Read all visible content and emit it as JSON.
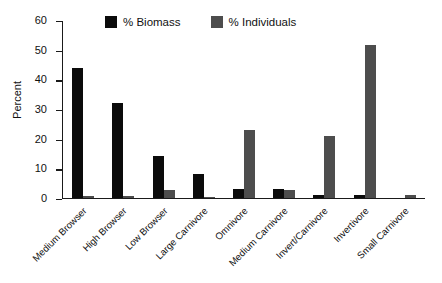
{
  "chart_data": {
    "type": "bar",
    "title": "",
    "xlabel": "",
    "ylabel": "Percent",
    "ylim": [
      0,
      60
    ],
    "yticks": [
      0,
      10,
      20,
      30,
      40,
      50,
      60
    ],
    "grid": false,
    "legend_position": "top",
    "categories": [
      "Medium Browser",
      "High Browser",
      "Low Browser",
      "Large Carnivore",
      "Omnivore",
      "Medium Carnivore",
      "Invert/Carnivore",
      "Invertivore",
      "Small Carnivore"
    ],
    "series": [
      {
        "name": "% Biomass",
        "color": "#0b0b0b",
        "values": [
          44,
          32,
          14,
          8,
          3,
          3,
          1,
          1,
          0
        ]
      },
      {
        "name": "% Individuals",
        "color": "#4d4d4d",
        "values": [
          0.5,
          0.5,
          2.5,
          0.3,
          23,
          2.5,
          21,
          52,
          1
        ]
      }
    ]
  },
  "legend": {
    "entries": [
      {
        "label": "% Biomass",
        "color": "#0b0b0b"
      },
      {
        "label": "% Individuals",
        "color": "#4d4d4d"
      }
    ]
  },
  "axes": {
    "y": {
      "label": "Percent",
      "tick_labels": [
        "0",
        "10",
        "20",
        "30",
        "40",
        "50",
        "60"
      ]
    }
  }
}
